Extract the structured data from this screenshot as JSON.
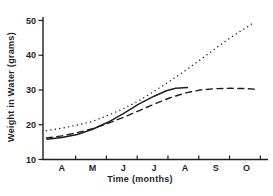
{
  "figure": {
    "background": "#ffffff",
    "ink": "#1f1f1f"
  },
  "chart_data": {
    "type": "line",
    "title": "",
    "xlabel": "Time  (months)",
    "ylabel": "Weight in Water (grams)",
    "x_tick_labels": [
      "A",
      "M",
      "J",
      "J",
      "A",
      "S",
      "O"
    ],
    "x_tick_label_positions": [
      0,
      1,
      2,
      3,
      4,
      5,
      6
    ],
    "x_tick_mark_positions": [
      0.45,
      1.45,
      2.45,
      3.45,
      4.45,
      5.45,
      6.45
    ],
    "y_ticks": [
      10,
      20,
      30,
      40,
      50
    ],
    "xlim": [
      -0.61,
      6.7
    ],
    "ylim": [
      10,
      51
    ],
    "grid": false,
    "legend_position": "none",
    "series": [
      {
        "name": "dotted-series",
        "style": "dotted",
        "points": [
          [
            -0.5,
            18.3
          ],
          [
            0,
            19.0
          ],
          [
            0.5,
            19.9
          ],
          [
            1,
            21.0
          ],
          [
            1.5,
            22.7
          ],
          [
            2,
            24.6
          ],
          [
            2.5,
            26.9
          ],
          [
            3,
            29.6
          ],
          [
            3.5,
            32.5
          ],
          [
            4,
            35.5
          ],
          [
            4.5,
            38.7
          ],
          [
            5,
            42.0
          ],
          [
            5.5,
            45.2
          ],
          [
            6,
            48.0
          ],
          [
            6.27,
            49.6
          ]
        ]
      },
      {
        "name": "solid-series",
        "style": "solid",
        "points": [
          [
            -0.5,
            15.8
          ],
          [
            0,
            16.3
          ],
          [
            0.5,
            17.2
          ],
          [
            1,
            18.7
          ],
          [
            1.5,
            20.7
          ],
          [
            2,
            23.2
          ],
          [
            2.5,
            25.9
          ],
          [
            3,
            28.2
          ],
          [
            3.4,
            29.8
          ],
          [
            3.7,
            30.5
          ],
          [
            4.1,
            30.7
          ]
        ]
      },
      {
        "name": "dashed-series",
        "style": "dashed",
        "points": [
          [
            -0.5,
            16.2
          ],
          [
            0,
            16.8
          ],
          [
            0.5,
            17.7
          ],
          [
            1,
            18.9
          ],
          [
            1.5,
            20.4
          ],
          [
            2,
            22.1
          ],
          [
            2.5,
            24.0
          ],
          [
            3,
            25.9
          ],
          [
            3.5,
            27.7
          ],
          [
            4,
            29.1
          ],
          [
            4.5,
            30.0
          ],
          [
            5,
            30.4
          ],
          [
            5.5,
            30.5
          ],
          [
            6,
            30.4
          ],
          [
            6.37,
            30.2
          ]
        ]
      }
    ]
  }
}
